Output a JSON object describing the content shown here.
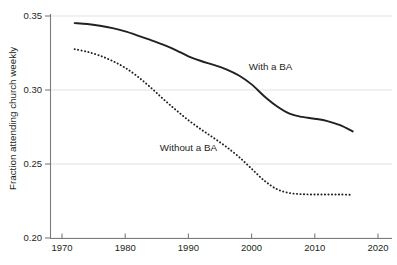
{
  "chart_data": {
    "type": "line",
    "title": "",
    "xlabel": "",
    "ylabel": "Fraction attending church weekly",
    "xlim": [
      1970,
      2020
    ],
    "ylim": [
      0.2,
      0.35
    ],
    "grid": true,
    "grid_axis": "y",
    "legend_position": "inline-annotation",
    "x_ticks": [
      "1970",
      "1980",
      "1990",
      "2000",
      "2010",
      "2020"
    ],
    "x_tick_values": [
      1970,
      1980,
      1990,
      2000,
      2010,
      2020
    ],
    "y_ticks": [
      "0.20",
      "0.25",
      "0.30",
      "0.35"
    ],
    "y_tick_values": [
      0.2,
      0.25,
      0.3,
      0.35
    ],
    "x": [
      1972,
      1974,
      1976,
      1978,
      1980,
      1982,
      1984,
      1986,
      1988,
      1990,
      1992,
      1994,
      1996,
      1998,
      2000,
      2002,
      2004,
      2006,
      2008,
      2010,
      2012,
      2014,
      2016
    ],
    "series": [
      {
        "name": "With a BA",
        "style": "solid",
        "color": "#231f20",
        "label_x": 2003,
        "label_y": 0.3135,
        "values": [
          0.3452,
          0.3446,
          0.3434,
          0.3418,
          0.3396,
          0.3368,
          0.3338,
          0.3306,
          0.327,
          0.3228,
          0.3196,
          0.317,
          0.314,
          0.3098,
          0.3038,
          0.2958,
          0.289,
          0.284,
          0.2818,
          0.2806,
          0.279,
          0.2762,
          0.272
        ]
      },
      {
        "name": "Without a BA",
        "style": "dotted",
        "color": "#231f20",
        "label_x": 1990,
        "label_y": 0.259,
        "values": [
          0.3276,
          0.3258,
          0.3232,
          0.3196,
          0.315,
          0.309,
          0.3018,
          0.294,
          0.2866,
          0.2796,
          0.2734,
          0.2676,
          0.2616,
          0.2548,
          0.2468,
          0.2388,
          0.233,
          0.2304,
          0.2296,
          0.2294,
          0.2294,
          0.2294,
          0.2292
        ]
      }
    ]
  },
  "axis": {
    "y_title": "Fraction attending church weekly"
  }
}
